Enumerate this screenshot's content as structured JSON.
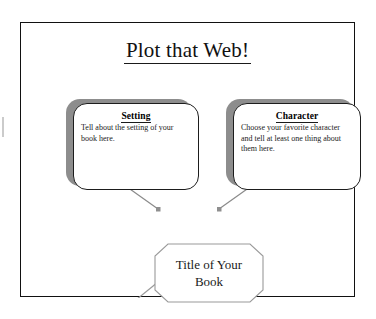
{
  "document": {
    "title": "Plot that Web!",
    "type": "graphic organizer worksheet"
  },
  "nodes": {
    "setting": {
      "heading": "Setting",
      "body": "Tell about the setting of your book here."
    },
    "character": {
      "heading": "Character",
      "body": "Choose your favorite character and tell at least one thing about them here."
    },
    "center": {
      "label": "Title of Your Book"
    }
  },
  "connectors": [
    {
      "name": "center-to-setting",
      "from": "center",
      "to": "setting",
      "arrowhead": "to-setting"
    },
    {
      "name": "center-to-character",
      "from": "center",
      "to": "character",
      "arrowhead": "to-character"
    },
    {
      "name": "center-to-lower-left",
      "from": "center",
      "to": "offscreen",
      "arrowhead": "none"
    },
    {
      "name": "center-to-lower-right",
      "from": "center",
      "to": "offscreen",
      "arrowhead": "none"
    }
  ],
  "colors": {
    "ink": "#111111",
    "body_ink": "#1b1b1b",
    "shadow": "#8d8d8d",
    "connector": "#8a8a8a",
    "octagon_outline": "#9a9a9a",
    "page": "#ffffff"
  }
}
